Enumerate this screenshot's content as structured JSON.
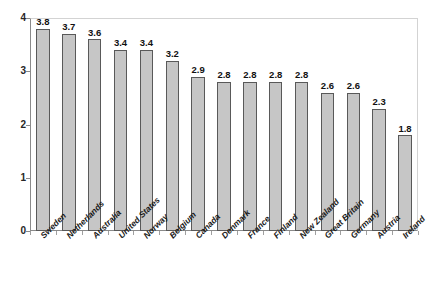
{
  "chart_data": {
    "type": "bar",
    "title": "",
    "subtitle": "",
    "xlabel": "",
    "ylabel": "",
    "ylim": [
      0,
      4
    ],
    "yticks": [
      "0",
      "1",
      "2",
      "3",
      "4"
    ],
    "grid": false,
    "legend": "none",
    "bar_color": "#c6c6c6",
    "bar_border_color": "#595959",
    "categories": [
      "Sweden",
      "Netherlands",
      "Australia",
      "United States",
      "Norway",
      "Belgium",
      "Canada",
      "Denmark",
      "France",
      "Finland",
      "New Zealand",
      "Great Britain",
      "Germany",
      "Austria",
      "Ireland"
    ],
    "values": [
      3.8,
      3.7,
      3.6,
      3.4,
      3.4,
      3.2,
      2.9,
      2.8,
      2.8,
      2.8,
      2.8,
      2.6,
      2.6,
      2.3,
      1.8
    ],
    "value_labels": [
      "3.8",
      "3.7",
      "3.6",
      "3.4",
      "3.4",
      "3.2",
      "2.9",
      "2.8",
      "2.8",
      "2.8",
      "2.8",
      "2.6",
      "2.6",
      "2.3",
      "1.8"
    ]
  }
}
